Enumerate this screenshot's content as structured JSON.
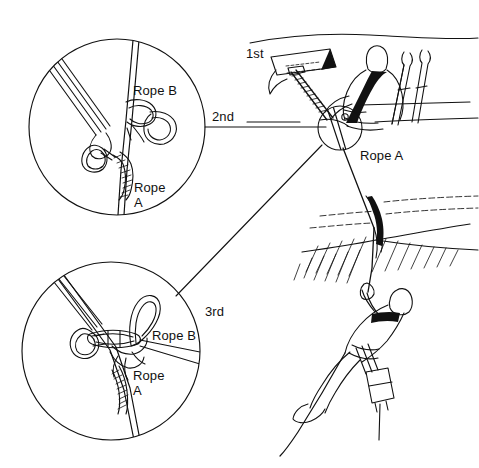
{
  "figure": {
    "width": 479,
    "height": 468,
    "background_color": "#ffffff",
    "ink_color": "#111111"
  },
  "labels": {
    "step_first": "1st",
    "step_second": "2nd",
    "step_third": "3rd",
    "main_rope_a": "Rope A",
    "detail1_rope_b": "Rope B",
    "detail1_rope_a_line1": "Rope",
    "detail1_rope_a_line2": "A",
    "detail2_rope_b": "Rope B",
    "detail2_rope_a_line1": "Rope",
    "detail2_rope_a_line2": "A"
  },
  "detail_circles": [
    {
      "name": "second-step-detail",
      "ordinal": "2nd",
      "cx": 117,
      "cy": 127,
      "r": 88,
      "contents": "Carabiner clipped to sling with friction hitch on Rope A and overhand knot with bight on Rope B"
    },
    {
      "name": "third-step-detail",
      "ordinal": "3rd",
      "cx": 111,
      "cy": 351,
      "r": 89,
      "contents": "Carabiner with loaded knot, bight loop and friction hitch wraps joining Rope A and Rope B"
    }
  ],
  "anchor_node": {
    "name": "master-point",
    "cx": 340,
    "cy": 128,
    "r": 22
  },
  "scene": {
    "upper": "Buried ice axe and snow picket anchor in the snow above a crevasse, with a belayer seated in the snow braced behind planted skis",
    "lower": "Climber suspended on Rope A inside the crevasse below the overhanging lip, wearing a pack"
  }
}
